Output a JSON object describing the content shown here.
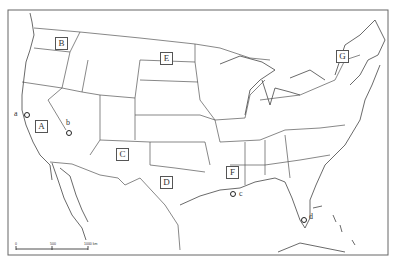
{
  "map": {
    "title": "United States outline map",
    "region_labels": [
      {
        "id": "A",
        "label": "A"
      },
      {
        "id": "B",
        "label": "B"
      },
      {
        "id": "C",
        "label": "C"
      },
      {
        "id": "D",
        "label": "D"
      },
      {
        "id": "E",
        "label": "E"
      },
      {
        "id": "F",
        "label": "F"
      },
      {
        "id": "G",
        "label": "G"
      }
    ],
    "point_labels": [
      {
        "id": "a",
        "label": "a"
      },
      {
        "id": "b",
        "label": "b"
      },
      {
        "id": "c",
        "label": "c"
      },
      {
        "id": "d",
        "label": "d"
      }
    ],
    "scale_bar": {
      "ticks": [
        "0",
        "500",
        "1000 km"
      ]
    }
  }
}
